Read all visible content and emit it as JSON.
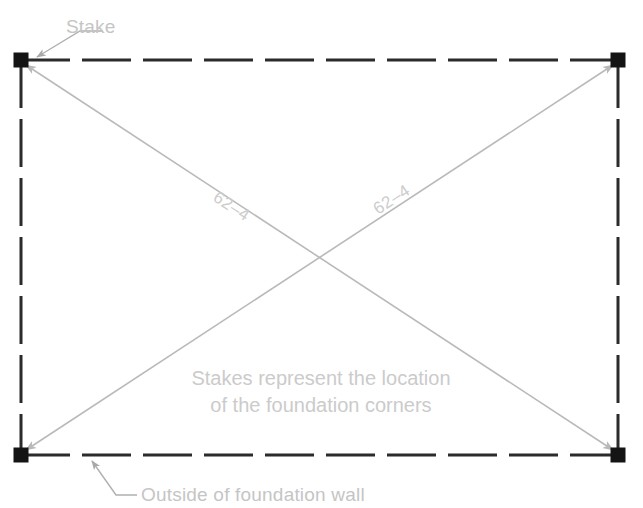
{
  "diagram": {
    "canvas": {
      "width": 643,
      "height": 508,
      "background": "#ffffff"
    },
    "colors": {
      "wall_line": "#2b2b2b",
      "stake_fill": "#141414",
      "diagonal_line": "#b9b9b9",
      "leader_line": "#b0b0b0",
      "annotation_text": "#c5c5c5",
      "dimension_text": "#cccccc"
    },
    "annotations": {
      "stake_label": "Stake",
      "wall_label": "Outside of foundation wall",
      "note_line_1": "Stakes represent the location",
      "note_line_2": "of the foundation corners"
    },
    "dimensions": [
      {
        "id": "diagonal-top-left-to-bottom-right",
        "label": "62–4"
      },
      {
        "id": "diagonal-top-right-to-bottom-left",
        "label": "62–4"
      }
    ],
    "stakes": [
      {
        "id": "stake-top-left",
        "x": 21,
        "y": 60
      },
      {
        "id": "stake-top-right",
        "x": 618,
        "y": 60
      },
      {
        "id": "stake-bottom-left",
        "x": 21,
        "y": 455
      },
      {
        "id": "stake-bottom-right",
        "x": 618,
        "y": 455
      }
    ]
  }
}
